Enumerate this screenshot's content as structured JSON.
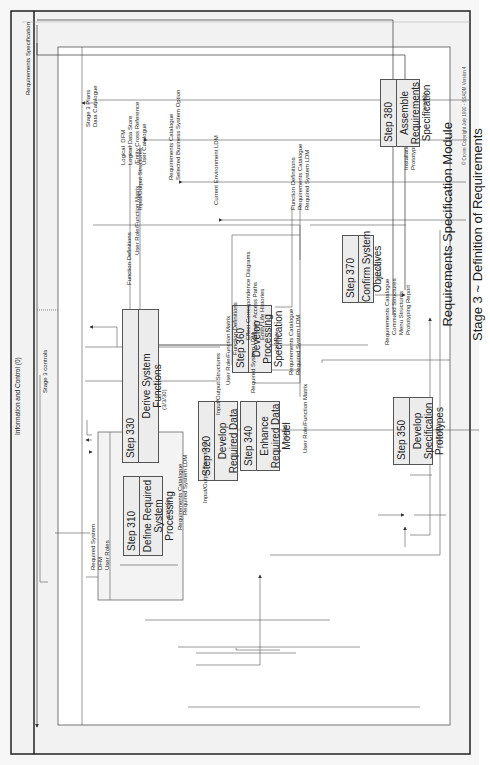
{
  "frame": {
    "info_control": "Information and Control (0)",
    "stage_controls": "Stage 3 controls"
  },
  "title": {
    "line1": "Requirements Specification Module",
    "line2": "Stage 3 ~ Definition of Requirements"
  },
  "copyright": "© Crown Copyright July 1990 - SSADM Version 4",
  "inputs": {
    "plans": "Stage 3 Plans\nData Catalogue",
    "logical": "Logical  DFM\nLogical Data Store\n/Entity Cross Reference\nUser Catalogue",
    "reqcat": "Requirements Catalogue\nSelected Business System Option",
    "ldm": "Current Environment LDM",
    "style": "Installation Style Guide\nPrototyping Scope"
  },
  "output": "Requirements Specification",
  "steps": [
    {
      "num": "Step  310",
      "name": "Define Required\nSystem\nProcessing",
      "ref": "(3/3/10)"
    },
    {
      "num": "Step  320",
      "name": "Develop\nRequired Data\nModel",
      "ref": "(3/3/20)"
    },
    {
      "num": "Step  330",
      "name": "Derive System\nFunctions",
      "ref": "(3/3/30)"
    },
    {
      "num": "Step  340",
      "name": "Enhance\nRequired Data\nModel",
      "ref": "(3/3/40)"
    },
    {
      "num": "Step  350",
      "name": "Develop\nSpecification\nPrototypes",
      "ref": "(3/3/50)"
    },
    {
      "num": "Step  360",
      "name": "Develop\nProcessing\nSpecification",
      "ref": "(3/3/60)"
    },
    {
      "num": "Step  370",
      "name": "Confirm System\nObjectives",
      "ref": "(3/3/70)"
    },
    {
      "num": "Step  380",
      "name": "Assemble\nRequirements\nSpecification",
      "ref": "(3/3/80)"
    }
  ],
  "flows": {
    "f310": "Required System\nDFM\nUser Roles",
    "f320": "Required System LDM",
    "reqcat330": "Requirements Catalogue",
    "io340": "Input/Output Structures",
    "ldm340": "Required System LDM",
    "urfm350": "User Role/Function Matrix",
    "io360": "Input/Output Structures",
    "urfm360": "User Role/Function Matrix",
    "fd360": "Function Definitions",
    "fd330": "Function Definitions",
    "urfm380": "User Role/Function Matrix",
    "io380": "Input/Output Structures",
    "ecd": "Effect Correspondence Diagrams\nEnquiry Access Paths\nEntity Life Histories",
    "rc360": "Requirements Catalogue\nRequired System LDM",
    "f370": "Function Definitions\nRequirements Catalogue\nRequired System LDM",
    "f350": "Requirements Catalogue\n      Command Structures\n      Menu Structures\n      Prototyping Report"
  }
}
